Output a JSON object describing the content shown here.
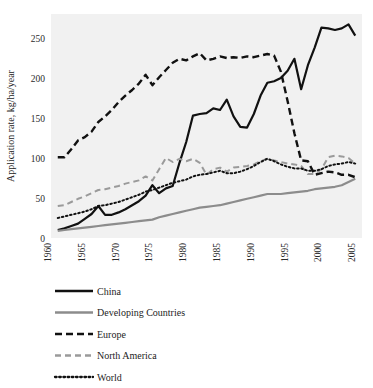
{
  "chart_data": {
    "type": "line",
    "title": "",
    "subtitle": "",
    "xlabel": "",
    "ylabel": "Application rate, kg/ha/year",
    "xlim": [
      1960,
      2006
    ],
    "ylim": [
      0,
      280
    ],
    "yticks": [
      0,
      50,
      100,
      150,
      200,
      250
    ],
    "ytick_labels": [
      "0",
      "50",
      "100",
      "150",
      "200",
      "250"
    ],
    "xticks": [
      1960,
      1965,
      1970,
      1975,
      1980,
      1985,
      1990,
      1995,
      2000,
      2005
    ],
    "xtick_labels": [
      "1960",
      "1965",
      "1970",
      "1975",
      "1980",
      "1985",
      "1990",
      "1995",
      "2000",
      "2005"
    ],
    "xtick_rotation": 90,
    "grid": false,
    "plot_background": "#f1f1f1",
    "legend_position": "below",
    "x": [
      1961,
      1962,
      1963,
      1964,
      1965,
      1966,
      1967,
      1968,
      1969,
      1970,
      1971,
      1972,
      1973,
      1974,
      1975,
      1976,
      1977,
      1978,
      1979,
      1980,
      1981,
      1982,
      1983,
      1984,
      1985,
      1986,
      1987,
      1988,
      1989,
      1990,
      1991,
      1992,
      1993,
      1994,
      1995,
      1996,
      1997,
      1998,
      1999,
      2000,
      2001,
      2002,
      2003,
      2004,
      2005
    ],
    "series": [
      {
        "name": "China",
        "color": "#111111",
        "style": "solid",
        "width": 2.2,
        "values": [
          10,
          12,
          15,
          18,
          24,
          30,
          40,
          29,
          29,
          32,
          36,
          41,
          46,
          53,
          66,
          56,
          62,
          65,
          94,
          120,
          153,
          155,
          156,
          162,
          160,
          173,
          152,
          139,
          138,
          155,
          178,
          194,
          196,
          200,
          209,
          224,
          186,
          216,
          238,
          263,
          262,
          260,
          262,
          267,
          253
        ]
      },
      {
        "name": "Developing Countries",
        "color": "#8c8c8c",
        "style": "solid",
        "width": 2.2,
        "values": [
          9,
          10,
          11,
          12,
          13,
          14,
          15,
          16,
          17,
          18,
          19,
          20,
          21,
          22,
          23,
          26,
          28,
          30,
          32,
          34,
          36,
          38,
          39,
          40,
          41,
          43,
          45,
          47,
          49,
          51,
          53,
          55,
          55,
          55,
          56,
          57,
          58,
          59,
          61,
          62,
          63,
          64,
          66,
          70,
          74
        ]
      },
      {
        "name": "Europe",
        "color": "#111111",
        "style": "dashed-thick",
        "width": 2.4,
        "values": [
          101,
          101,
          111,
          122,
          126,
          133,
          145,
          152,
          160,
          170,
          178,
          185,
          193,
          204,
          191,
          201,
          210,
          219,
          224,
          222,
          227,
          231,
          222,
          224,
          227,
          225,
          226,
          225,
          227,
          226,
          228,
          230,
          228,
          208,
          171,
          131,
          97,
          96,
          79,
          81,
          83,
          82,
          79,
          79,
          76
        ]
      },
      {
        "name": "North America",
        "color": "#9a9a9a",
        "style": "dashed",
        "width": 2.0,
        "values": [
          40,
          41,
          45,
          49,
          52,
          56,
          60,
          61,
          63,
          65,
          68,
          70,
          72,
          77,
          72,
          86,
          100,
          95,
          99,
          96,
          99,
          94,
          79,
          86,
          88,
          83,
          88,
          89,
          90,
          92,
          96,
          99,
          97,
          95,
          93,
          92,
          90,
          80,
          80,
          86,
          101,
          103,
          102,
          100,
          93
        ]
      },
      {
        "name": "World",
        "color": "#111111",
        "style": "dotted",
        "width": 2.0,
        "values": [
          25,
          27,
          29,
          31,
          33,
          36,
          40,
          41,
          43,
          45,
          48,
          51,
          54,
          58,
          60,
          63,
          66,
          69,
          71,
          73,
          77,
          79,
          80,
          82,
          84,
          81,
          81,
          83,
          86,
          90,
          95,
          99,
          96,
          92,
          89,
          87,
          87,
          84,
          84,
          86,
          90,
          92,
          93,
          95,
          93
        ]
      }
    ]
  },
  "legend": {
    "items": [
      {
        "label": "China",
        "swatch": "line-solid-black"
      },
      {
        "label": "Developing Countries",
        "swatch": "line-solid-gray"
      },
      {
        "label": "Europe",
        "swatch": "line-dashed-black"
      },
      {
        "label": "North America",
        "swatch": "line-dashed-gray"
      },
      {
        "label": "World",
        "swatch": "line-dotted-black"
      }
    ]
  }
}
